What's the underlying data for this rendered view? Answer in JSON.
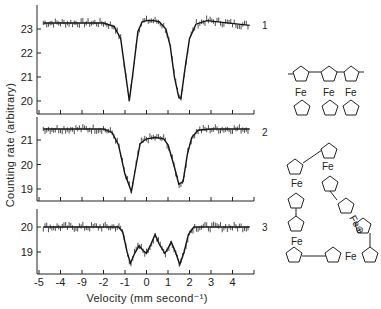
{
  "chart_data": {
    "type": "line",
    "title": "",
    "xlabel": "Velocity (mm second⁻¹)",
    "ylabel": "Counting rate (arbitrary)",
    "x_ticks": [
      -5,
      -4,
      -3,
      -2,
      -1,
      0,
      1,
      2,
      3,
      4
    ],
    "x_tick_labels": [
      "-5",
      "-4",
      "-9",
      "-2",
      "-1",
      "0",
      "1",
      "2",
      "3",
      "4"
    ],
    "xlim": [
      -5,
      5
    ],
    "grid": false,
    "legend": "none",
    "panels": [
      {
        "label": "1",
        "ylim": [
          19.5,
          23.8
        ],
        "y_ticks": [
          20,
          21,
          22,
          23
        ],
        "baseline": 23.25,
        "series": [
          {
            "name": "fit",
            "x": [
              -4.8,
              -2.0,
              -1.5,
              -1.2,
              -1.0,
              -0.8,
              -0.6,
              -0.4,
              -0.2,
              0.0,
              0.3,
              0.6,
              0.9,
              1.1,
              1.3,
              1.5,
              1.6,
              1.8,
              2.0,
              2.3,
              2.8,
              4.8
            ],
            "y": [
              23.25,
              23.25,
              23.1,
              22.6,
              21.3,
              20.0,
              21.4,
              22.9,
              23.3,
              23.35,
              23.35,
              23.3,
              23.0,
              22.3,
              21.0,
              20.15,
              20.1,
              21.4,
              22.6,
              23.2,
              23.35,
              23.15
            ]
          }
        ]
      },
      {
        "label": "2",
        "ylim": [
          18.6,
          21.7
        ],
        "y_ticks": [
          19,
          20,
          21
        ],
        "baseline": 21.45,
        "series": [
          {
            "name": "fit",
            "x": [
              -4.8,
              -2.0,
              -1.6,
              -1.3,
              -1.0,
              -0.7,
              -0.5,
              -0.3,
              0.0,
              0.4,
              0.8,
              1.0,
              1.3,
              1.5,
              1.7,
              1.9,
              2.1,
              2.4,
              3.0,
              4.8
            ],
            "y": [
              21.45,
              21.45,
              21.3,
              20.8,
              19.6,
              18.9,
              19.9,
              20.85,
              21.05,
              21.1,
              21.05,
              20.8,
              19.9,
              19.2,
              19.3,
              20.4,
              21.1,
              21.4,
              21.45,
              21.45
            ]
          }
        ]
      },
      {
        "label": "3",
        "ylim": [
          18.3,
          20.5
        ],
        "y_ticks": [
          19,
          20
        ],
        "baseline": 20.0,
        "series": [
          {
            "name": "fit",
            "x": [
              -4.8,
              -1.3,
              -1.1,
              -0.9,
              -0.75,
              -0.55,
              -0.35,
              -0.15,
              0.0,
              0.2,
              0.4,
              0.6,
              0.85,
              1.0,
              1.15,
              1.35,
              1.55,
              1.75,
              1.95,
              2.2,
              4.8
            ],
            "y": [
              20.0,
              20.0,
              19.8,
              19.0,
              18.55,
              18.95,
              19.25,
              19.05,
              18.95,
              19.3,
              19.7,
              19.3,
              18.95,
              19.15,
              19.4,
              19.0,
              18.5,
              19.0,
              19.7,
              20.0,
              20.0
            ]
          }
        ]
      }
    ]
  },
  "figure": {
    "panel_labels": [
      "1",
      "2",
      "3"
    ],
    "structures": {
      "top": {
        "type": "linear ferrocene polymer",
        "fe_labels": [
          "Fe",
          "Fe",
          "Fe"
        ]
      },
      "bottom": {
        "type": "cyclic ferrocene oligomer",
        "fe_labels": [
          "Fe",
          "Fe",
          "Fe",
          "Fe",
          "Fe",
          "Fe"
        ],
        "charged_fe": "Fe⊕"
      }
    }
  }
}
